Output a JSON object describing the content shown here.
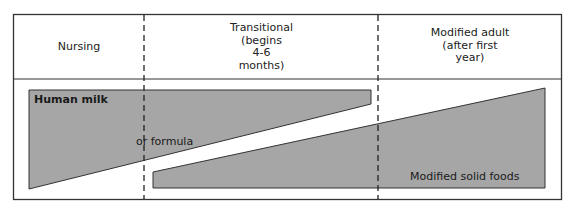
{
  "diagram": {
    "stages": [
      {
        "id": "nursing",
        "label": "Nursing"
      },
      {
        "id": "transitional",
        "label_lines": [
          "Transitional",
          "(begins",
          "4-6",
          "months)"
        ]
      },
      {
        "id": "modified_adult",
        "label_lines": [
          "Modified adult",
          "(after first",
          "year)"
        ]
      }
    ],
    "bands": [
      {
        "id": "human_milk",
        "label": "Human milk",
        "sub_label": "or formula",
        "trend": "decreasing"
      },
      {
        "id": "solid_foods",
        "label": "Modified solid foods",
        "trend": "increasing"
      }
    ],
    "colors": {
      "band_fill": "#a6a6a6",
      "border": "#333333",
      "background": "#ffffff"
    }
  }
}
